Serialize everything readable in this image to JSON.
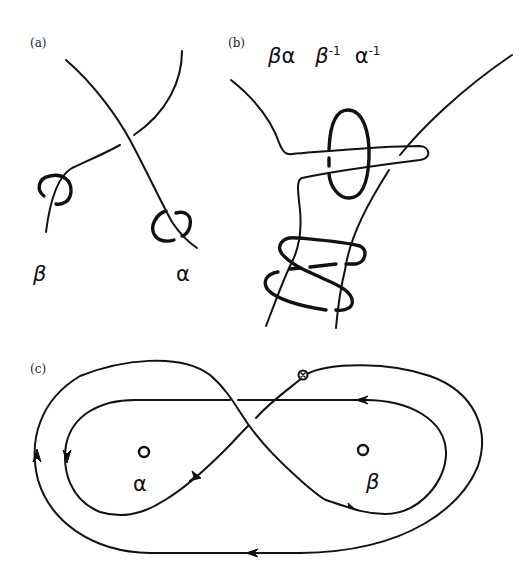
{
  "figure": {
    "panels": [
      {
        "id": "a",
        "label": "(a)",
        "description": "Two strands crossing, each linked by a small meridian loop",
        "generators": [
          {
            "symbol": "β",
            "name": "beta"
          },
          {
            "symbol": "α",
            "name": "alpha"
          }
        ]
      },
      {
        "id": "b",
        "label": "(b)",
        "description": "Commutator word realised as a band wrapping around meridian loops",
        "word": [
          {
            "symbol": "β",
            "exponent": ""
          },
          {
            "symbol": "α",
            "exponent": ""
          },
          {
            "symbol": "β",
            "exponent": "-1"
          },
          {
            "symbol": "α",
            "exponent": "-1"
          }
        ]
      },
      {
        "id": "c",
        "label": "(c)",
        "description": "Figure-eight loop around two punctures with a basepoint and direction arrows",
        "punctures": [
          {
            "symbol": "α",
            "name": "alpha"
          },
          {
            "symbol": "β",
            "name": "beta"
          }
        ],
        "basepoint": "⊗",
        "arrows": [
          "outer-left-up",
          "inner-left-down",
          "inner-lower-left-up-right",
          "inner-top-right-left",
          "inner-lower-right-right",
          "outer-bottom-left"
        ]
      }
    ]
  }
}
